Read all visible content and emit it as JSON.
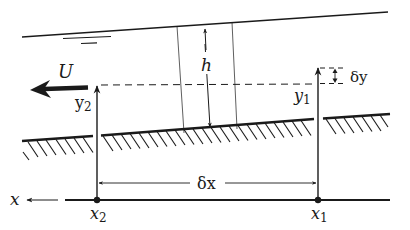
{
  "diagram": {
    "type": "open-channel-flow-control-volume",
    "labels": {
      "velocity": "U",
      "depth": "h",
      "y2": "y",
      "y2_sub": "2",
      "y1": "y",
      "y1_sub": "1",
      "delta_y": "δy",
      "delta_x": "δx",
      "axis": "x",
      "x2": "x",
      "x2_sub": "2",
      "x1": "x",
      "x1_sub": "1"
    },
    "elements": [
      "free-surface",
      "water-level-symbol",
      "channel-bed",
      "bed-hatching",
      "control-volume-sides",
      "depth-arrow",
      "reference-dashed-line",
      "velocity-arrow",
      "datum-line",
      "station-markers"
    ],
    "colors": {
      "ink": "#1a1a1a",
      "background": "#ffffff"
    }
  }
}
